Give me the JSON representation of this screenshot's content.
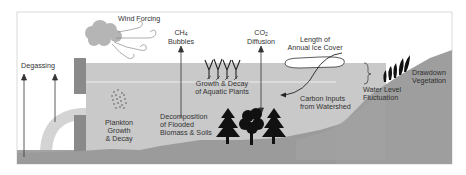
{
  "diagram": {
    "colors": {
      "background": "#ffffff",
      "frame": "#cfcfcf",
      "air": "#ffffff",
      "water": "#c8c8c8",
      "water_line": "#ececec",
      "sediment": "#9a9a9a",
      "land": "#9d9d9d",
      "dam": "#8a8a8a",
      "spillway": "#d6d6d6",
      "cloud": "#b5b5b5",
      "trees": "#111111",
      "text": "#333333"
    },
    "labels": {
      "wind_forcing": "Wind Forcing",
      "degassing": "Degassing",
      "ch4_line1": "CH",
      "ch4_sub": "4",
      "ch4_line2": "Bubbles",
      "co2_line1": "CO",
      "co2_sub": "2",
      "co2_line2": "Diffusion",
      "ice_line1": "Length of",
      "ice_line2": "Annual Ice Cover",
      "aquatic_line1": "Growth & Decay",
      "aquatic_line2": "of Aquatic Plants",
      "plankton_line1": "Plankton",
      "plankton_line2": "Growth",
      "plankton_line3": "& Decay",
      "decomp_line1": "Decomposition",
      "decomp_line2": "of Flooded",
      "decomp_line3": "Biomass & Soils",
      "carbon_line1": "Carbon Inputs",
      "carbon_line2": "from Watershed",
      "water_level_line1": "Water Level",
      "water_level_line2": "Fluctuation",
      "drawdown_line1": "Drawdown",
      "drawdown_line2": "Vegetation"
    },
    "icons": [
      "cloud-icon",
      "wind-gust-icon",
      "up-arrow-icon",
      "double-arrow-icon",
      "aquatic-plants-icon",
      "plankton-dots-icon",
      "conifer-tree-icon",
      "deciduous-tree-icon",
      "ice-cover-icon",
      "brace-icon",
      "drawdown-vegetation-icon"
    ]
  }
}
